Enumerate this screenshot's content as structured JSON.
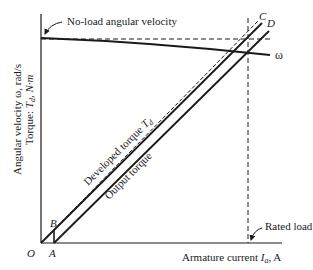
{
  "diagram": {
    "type": "dc-motor-characteristics",
    "y_axis_label_line1": "Angular velocity ω, rad/s",
    "y_axis_label_line2_prefix": "Torque: ",
    "y_axis_label_line2_var": "T",
    "y_axis_label_line2_sub": "d",
    "y_axis_label_line2_suffix": ", N·m",
    "x_axis_label_prefix": "Armature current ",
    "x_axis_label_var": "I",
    "x_axis_label_sub": "a",
    "x_axis_label_suffix": ", A",
    "annotations": {
      "no_load": "No-load angular velocity",
      "rated_load": "Rated load",
      "developed_torque_prefix": "Developed torque ",
      "developed_torque_var": "T",
      "developed_torque_sub": "d",
      "output_torque": "Output torque",
      "omega": "ω"
    },
    "points": {
      "O": "O",
      "A": "A",
      "B": "B",
      "C": "C",
      "D": "D"
    },
    "colors": {
      "line": "#1a1a1a",
      "background": "#ffffff"
    }
  }
}
